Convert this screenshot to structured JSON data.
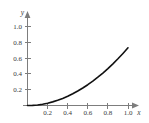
{
  "chart_data": {
    "type": "line",
    "title": "",
    "subtitle": "",
    "xlabel": "x",
    "ylabel": "y",
    "xlim": [
      0,
      1.12
    ],
    "ylim": [
      0,
      1.08
    ],
    "grid": false,
    "legend": null,
    "x_ticks": [
      0.2,
      0.4,
      0.6,
      0.8,
      1.0
    ],
    "x_tick_labels": [
      "0.2",
      "0.4",
      "0.6",
      "0.8",
      "1.0"
    ],
    "y_ticks": [
      0.2,
      0.4,
      0.6,
      0.8,
      1.0
    ],
    "y_tick_labels": [
      "0.2",
      "0.4",
      "0.6",
      "0.8",
      "1.0"
    ],
    "series": [
      {
        "name": "curve",
        "color": "#111111",
        "x": [
          0.0,
          0.05,
          0.1,
          0.15,
          0.2,
          0.25,
          0.3,
          0.35,
          0.4,
          0.45,
          0.5,
          0.55,
          0.6,
          0.65,
          0.7,
          0.75,
          0.8,
          0.85,
          0.9,
          0.95,
          1.0
        ],
        "y": [
          0.0,
          0.002,
          0.007,
          0.016,
          0.029,
          0.046,
          0.066,
          0.089,
          0.117,
          0.148,
          0.183,
          0.221,
          0.263,
          0.308,
          0.358,
          0.411,
          0.467,
          0.527,
          0.591,
          0.659,
          0.73
        ]
      }
    ],
    "axis_color": "#7d7d7d",
    "curve_color": "#111111",
    "background_color": "#ffffff"
  },
  "axis_labels": {
    "x": "x",
    "y": "y"
  }
}
